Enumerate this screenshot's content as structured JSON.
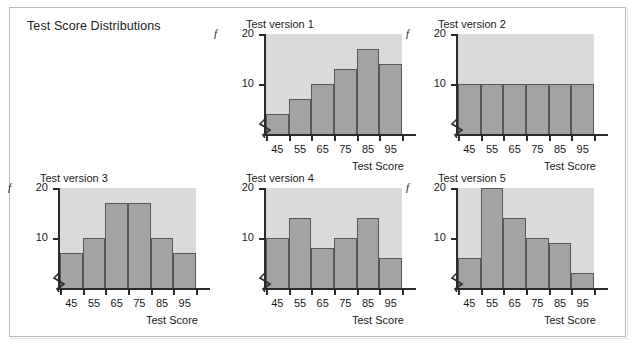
{
  "figure": {
    "title": "Test Score Distributions",
    "width": 634,
    "height": 345
  },
  "style": {
    "bar_fill": "#a3a3a3",
    "bar_stroke": "#585858",
    "plot_background": "#dadada",
    "axis_color": "#2b2b2b",
    "frame_border": "#b9b9b9",
    "page_background": "#ffffff",
    "text_color": "#1a1a1a"
  },
  "shared": {
    "y_label": "f",
    "x_label": "Test Score",
    "categories": [
      "45",
      "55",
      "65",
      "75",
      "85",
      "95"
    ],
    "y_ticks": [
      "10",
      "20"
    ],
    "ylim": [
      0,
      20
    ],
    "axis_break_symbol": "zigzag"
  },
  "chart_data": [
    {
      "type": "bar",
      "title": "Test version 1",
      "xlabel": "Test Score",
      "ylabel": "f",
      "categories": [
        "45",
        "55",
        "65",
        "75",
        "85",
        "95"
      ],
      "values": [
        4,
        7,
        10,
        13,
        17,
        14
      ],
      "ylim": [
        0,
        20
      ],
      "yticks": [
        10,
        20
      ],
      "grid": false,
      "legend": null,
      "shape": "skewed-left",
      "show_y_label": true
    },
    {
      "type": "bar",
      "title": "Test version 2",
      "xlabel": "Test Score",
      "ylabel": "f",
      "categories": [
        "45",
        "55",
        "65",
        "75",
        "85",
        "95"
      ],
      "values": [
        10,
        10,
        10,
        10,
        10,
        10
      ],
      "ylim": [
        0,
        20
      ],
      "yticks": [
        10,
        20
      ],
      "grid": false,
      "legend": null,
      "shape": "uniform",
      "show_y_label": true
    },
    {
      "type": "bar",
      "title": "Test version 3",
      "xlabel": "Test Score",
      "ylabel": "f",
      "categories": [
        "45",
        "55",
        "65",
        "75",
        "85",
        "95"
      ],
      "values": [
        7,
        10,
        17,
        17,
        10,
        7
      ],
      "ylim": [
        0,
        20
      ],
      "yticks": [
        10,
        20
      ],
      "grid": false,
      "legend": null,
      "shape": "symmetric",
      "show_y_label": true
    },
    {
      "type": "bar",
      "title": "Test version 4",
      "xlabel": "Test Score",
      "ylabel": "",
      "categories": [
        "45",
        "55",
        "65",
        "75",
        "85",
        "95"
      ],
      "values": [
        10,
        14,
        8,
        10,
        14,
        6
      ],
      "ylim": [
        0,
        20
      ],
      "yticks": [
        10,
        20
      ],
      "grid": false,
      "legend": null,
      "shape": "bimodal",
      "show_y_label": false
    },
    {
      "type": "bar",
      "title": "Test version 5",
      "xlabel": "Test Score",
      "ylabel": "f",
      "categories": [
        "45",
        "55",
        "65",
        "75",
        "85",
        "95"
      ],
      "values": [
        6,
        20,
        14,
        10,
        9,
        3
      ],
      "ylim": [
        0,
        20
      ],
      "yticks": [
        10,
        20
      ],
      "grid": false,
      "legend": null,
      "shape": "skewed-right",
      "show_y_label": true
    }
  ],
  "layout": {
    "panels": [
      {
        "index": 0,
        "left": 228,
        "top": 18
      },
      {
        "index": 1,
        "left": 420,
        "top": 18
      },
      {
        "index": 2,
        "left": 22,
        "top": 172
      },
      {
        "index": 3,
        "left": 228,
        "top": 172
      },
      {
        "index": 4,
        "left": 420,
        "top": 172
      }
    ],
    "plot_width": 136,
    "plot_height": 100
  }
}
